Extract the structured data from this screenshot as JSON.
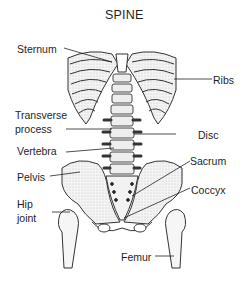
{
  "diagram": {
    "title": "SPINE",
    "labels": {
      "sternum": "Sternum",
      "ribs": "Ribs",
      "transverse_process_line1": "Transverse",
      "transverse_process_line2": "process",
      "disc": "Disc",
      "vertebra": "Vertebra",
      "sacrum": "Sacrum",
      "pelvis": "Pelvis",
      "coccyx": "Coccyx",
      "hip_joint_line1": "Hip",
      "hip_joint_line2": "joint",
      "femur": "Femur"
    }
  }
}
